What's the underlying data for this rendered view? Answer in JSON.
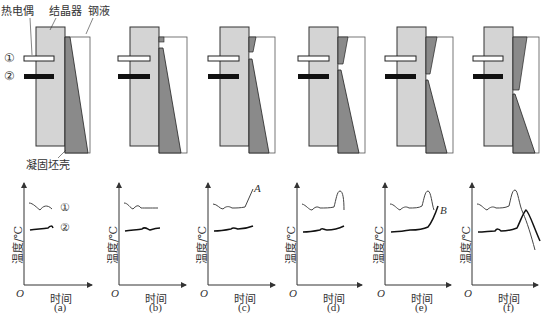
{
  "figure": {
    "labels": {
      "thermocouple": "热电偶",
      "mould": "结晶器",
      "molten_steel": "钢液",
      "solidified_shell": "凝固坯壳",
      "marker_1": "①",
      "marker_2": "②"
    },
    "panels": [
      {
        "id": "a",
        "label": "(a)"
      },
      {
        "id": "b",
        "label": "(b)"
      },
      {
        "id": "c",
        "label": "(c)"
      },
      {
        "id": "d",
        "label": "(d)"
      },
      {
        "id": "e",
        "label": "(e)"
      },
      {
        "id": "f",
        "label": "(f)"
      }
    ],
    "graph": {
      "ylabel": "温度/℃",
      "xlabel": "时间",
      "origin": "O",
      "annotation_c": "A",
      "annotation_e": "B"
    },
    "colors": {
      "mould": "#d4d4d4",
      "shell": "#8a8a8a",
      "thermocouple_1": "#ffffff",
      "thermocouple_2": "#111111"
    }
  }
}
